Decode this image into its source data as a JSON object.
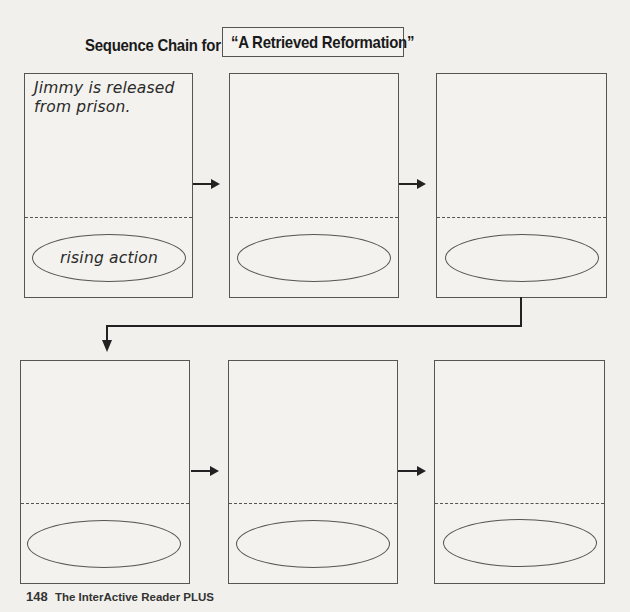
{
  "header": {
    "label": "Sequence Chain for",
    "story_title": "“A Retrieved Reformation”"
  },
  "chain": {
    "rows": [
      {
        "boxes": [
          {
            "event": "Jimmy is released from prison.",
            "plot_stage": "rising action"
          },
          {
            "event": "",
            "plot_stage": ""
          },
          {
            "event": "",
            "plot_stage": ""
          }
        ]
      },
      {
        "boxes": [
          {
            "event": "",
            "plot_stage": ""
          },
          {
            "event": "",
            "plot_stage": ""
          },
          {
            "event": "",
            "plot_stage": ""
          }
        ]
      }
    ],
    "arrow_icon": "right-arrow-icon",
    "connector_icon": "down-arrow-icon"
  },
  "footer": {
    "page_number": "148",
    "book_title": "The InterActive Reader PLUS"
  },
  "colors": {
    "background": "#f1f0ec",
    "line": "#555555",
    "arrow": "#222222",
    "text": "#1a1a1a"
  }
}
